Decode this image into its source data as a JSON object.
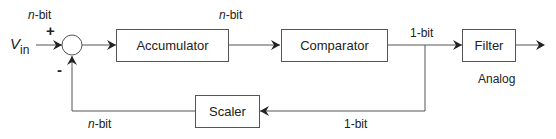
{
  "diagram": {
    "type": "block-diagram",
    "input": {
      "symbol": "V",
      "subscript": "in"
    },
    "summing_junction": {
      "plus": "+",
      "minus": "-"
    },
    "blocks": [
      {
        "id": "accumulator",
        "label": "Accumulator"
      },
      {
        "id": "comparator",
        "label": "Comparator"
      },
      {
        "id": "filter",
        "label": "Filter"
      },
      {
        "id": "scaler",
        "label": "Scaler"
      }
    ],
    "labels": {
      "input_width_n": "n",
      "input_width_suffix": "-bit",
      "acc_out_n": "n",
      "acc_out_suffix": "-bit",
      "comp_out": "1-bit",
      "feedback_in": "1-bit",
      "feedback_out_n": "n",
      "feedback_out_suffix": "-bit",
      "output": "Analog"
    }
  }
}
